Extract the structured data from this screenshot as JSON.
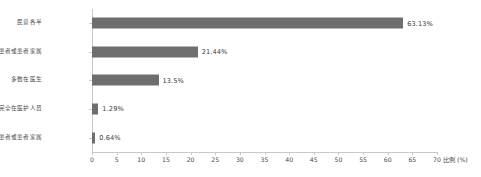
{
  "chart_data": {
    "type": "bar",
    "orientation": "horizontal",
    "title": "",
    "xlabel": "比例 (%)",
    "ylabel": "",
    "xlim": [
      0,
      70
    ],
    "xticks": [
      0,
      5,
      10,
      15,
      20,
      25,
      30,
      35,
      40,
      45,
      50,
      55,
      60,
      65,
      70
    ],
    "grid": false,
    "legend": null,
    "bar_color": "#6e6e6e",
    "categories": [
      "民意各半",
      "多数在患者或患者家属",
      "多数在医生",
      "完全在医护人员",
      "完全在患者或患者家属"
    ],
    "values": [
      63.13,
      21.44,
      13.5,
      1.29,
      0.64
    ],
    "data_labels": [
      "63.13%",
      "21.44%",
      "13.5%",
      "1.29%",
      "0.64%"
    ]
  }
}
